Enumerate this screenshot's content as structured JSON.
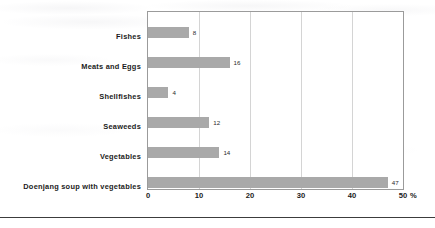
{
  "chart_data": {
    "type": "bar",
    "orientation": "horizontal",
    "title": "",
    "subtitle": "",
    "xlabel": "",
    "ylabel": "",
    "unit": "%",
    "unit_label": "%",
    "xlim": [
      0,
      50
    ],
    "xticks": [
      0,
      10,
      20,
      30,
      40,
      50
    ],
    "xtick_labels": [
      "0",
      "10",
      "20",
      "30",
      "40",
      "50"
    ],
    "grid": "vertical",
    "legend": "none",
    "bar_color": "#a9a9a9",
    "frame_color": "#9b9b9b",
    "gridline_color": "#d4d4d4",
    "categories": [
      "Fishes",
      "Meats and Eggs",
      "Shellfishes",
      "Seaweeds",
      "Vegetables",
      "Doenjang soup with vegetables"
    ],
    "values": [
      8,
      16,
      4,
      12,
      14,
      47
    ],
    "data_labels": [
      "8",
      "16",
      "4",
      "12",
      "14",
      "47"
    ]
  }
}
